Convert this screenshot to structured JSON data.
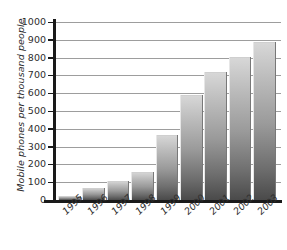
{
  "chart_data": {
    "type": "bar",
    "title": "",
    "xlabel": "",
    "ylabel": "Mobile phones per thousand people",
    "categories": [
      "1995",
      "1996",
      "1997",
      "1998",
      "1999",
      "2000",
      "2001",
      "2002",
      "2003"
    ],
    "values": [
      20,
      70,
      105,
      155,
      365,
      590,
      720,
      805,
      890
    ],
    "ylim": [
      0,
      1000
    ],
    "yticks": [
      0,
      100,
      200,
      300,
      400,
      500,
      600,
      700,
      800,
      900,
      1000
    ],
    "ytick_labels": [
      "0",
      "100",
      "200",
      "300",
      "400",
      "500",
      "600",
      "700",
      "800",
      "900",
      "1000"
    ],
    "grid": true,
    "legend": false,
    "bar_color": "#9a9a9a"
  },
  "axes": {
    "y_title": "Mobile phones per thousand people"
  }
}
